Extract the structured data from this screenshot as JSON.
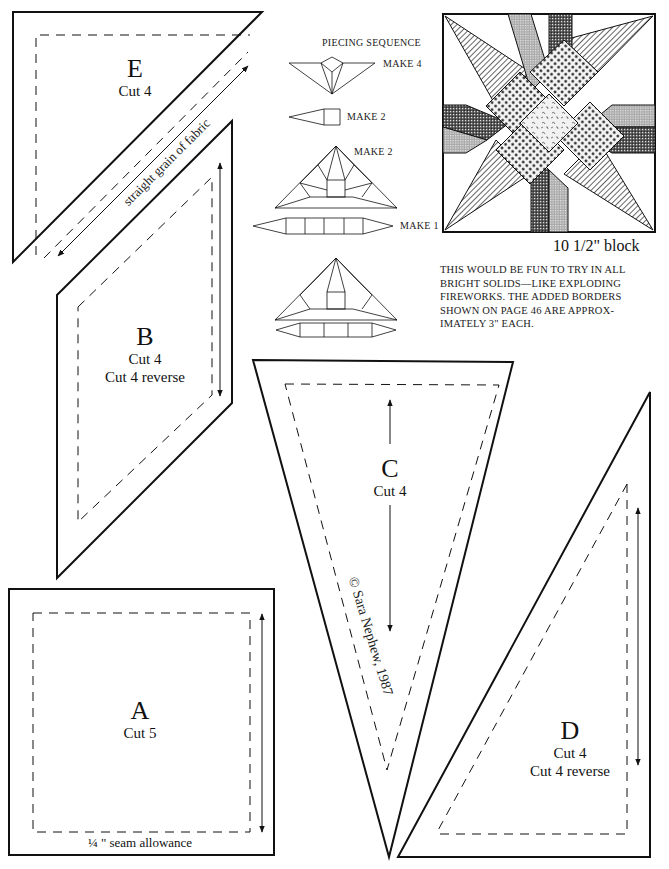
{
  "pattern_pieces": {
    "E": {
      "letter": "E",
      "cut": "Cut 4",
      "grain_label": "straight grain of fabric"
    },
    "B": {
      "letter": "B",
      "cut": "Cut 4",
      "cut_reverse": "Cut 4 reverse"
    },
    "C": {
      "letter": "C",
      "cut": "Cut 4",
      "copyright": "© Sara Nephew, 1987"
    },
    "A": {
      "letter": "A",
      "cut": "Cut 5",
      "seam_note": "¼ \" seam allowance"
    },
    "D": {
      "letter": "D",
      "cut": "Cut 4",
      "cut_reverse": "Cut 4 reverse"
    }
  },
  "piecing": {
    "title": "PIECING SEQUENCE",
    "steps": [
      {
        "make": "MAKE 4",
        "pieces": [
          "D",
          "E",
          "BR",
          "B",
          "DR"
        ]
      },
      {
        "make": "MAKE 2",
        "pieces": [
          "C",
          "A"
        ]
      },
      {
        "make": "MAKE 2",
        "pieces": [
          "D",
          "E",
          "DR",
          "C",
          "D",
          "BR",
          "B",
          "A",
          "BR",
          "E",
          "B",
          "DR"
        ]
      },
      {
        "make": "MAKE 1",
        "pieces": [
          "C",
          "A",
          "A",
          "A",
          "C"
        ]
      }
    ]
  },
  "block": {
    "caption": "10 1/2\" block"
  },
  "note": "THIS WOULD BE FUN TO TRY IN ALL BRIGHT SOLIDS—LIKE EXPLODING FIREWORKS. THE ADDED BORDERS SHOWN ON PAGE 46 ARE APPROX-IMATELY 3\" EACH."
}
